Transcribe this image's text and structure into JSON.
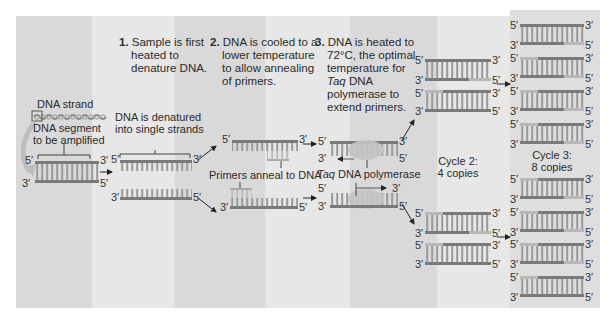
{
  "panels": {
    "intro": {
      "dna_strand_label": "DNA strand",
      "segment_label_line1": "DNA segment",
      "segment_label_line2": "to be amplified"
    },
    "step1": {
      "number": "1.",
      "text_line1": "Sample is first",
      "text_line2": "heated to",
      "text_line3": "denature DNA.",
      "caption_line1": "DNA is denatured",
      "caption_line2": "into single strands"
    },
    "step2": {
      "number": "2.",
      "text_line1": "DNA is cooled to a",
      "text_line2": "lower temperature",
      "text_line3": "to allow annealing",
      "text_line4": "of primers.",
      "caption": "Primers anneal to DNA"
    },
    "step3": {
      "number": "3.",
      "text_line1": "DNA is heated to",
      "text_line2": "72°C, the optimal",
      "text_line3": "temperature for",
      "text_line4_italic": "Taq",
      "text_line4_rest": " DNA",
      "text_line5": "polymerase to",
      "text_line6": "extend primers.",
      "caption_italic": "Taq",
      "caption_rest": " DNA polymerase"
    },
    "cycle2": {
      "title_line1": "Cycle 2:",
      "title_line2": "4 copies"
    },
    "cycle3": {
      "title_line1": "Cycle 3:",
      "title_line2": "8 copies"
    }
  },
  "strand_ends": {
    "five_prime": "5′",
    "three_prime": "3′"
  },
  "colors": {
    "panel_dark": "#d9d9d9",
    "panel_light": "#e6e6e6",
    "strand_dark": "#7a7a7a",
    "strand_light": "#b8b8b8",
    "polymerase": "#c4c4c4"
  }
}
